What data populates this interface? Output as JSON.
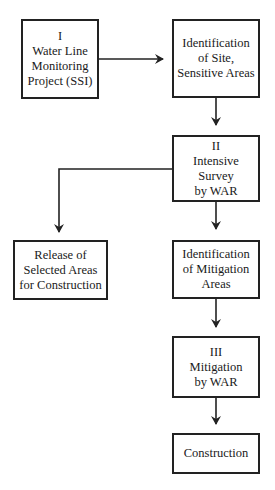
{
  "diagram": {
    "type": "flowchart",
    "nodes": [
      {
        "id": "n1",
        "lines": [
          "I",
          "Water Line",
          "Monitoring",
          "Project (SSI)"
        ]
      },
      {
        "id": "n2",
        "lines": [
          "Identification",
          "of Site,",
          "Sensitive Areas"
        ]
      },
      {
        "id": "n3",
        "lines": [
          "II",
          "Intensive",
          "Survey",
          "by WAR"
        ]
      },
      {
        "id": "n4",
        "lines": [
          "Release of",
          "Selected Areas",
          "for Construction"
        ]
      },
      {
        "id": "n5",
        "lines": [
          "Identification",
          "of Mitigation",
          "Areas"
        ]
      },
      {
        "id": "n6",
        "lines": [
          "III",
          "Mitigation",
          "by WAR"
        ]
      },
      {
        "id": "n7",
        "lines": [
          "Construction"
        ]
      }
    ],
    "edges": [
      {
        "from": "n1",
        "to": "n2"
      },
      {
        "from": "n2",
        "to": "n3"
      },
      {
        "from": "n3",
        "to": "n4"
      },
      {
        "from": "n3",
        "to": "n5"
      },
      {
        "from": "n5",
        "to": "n6"
      },
      {
        "from": "n6",
        "to": "n7"
      }
    ]
  }
}
